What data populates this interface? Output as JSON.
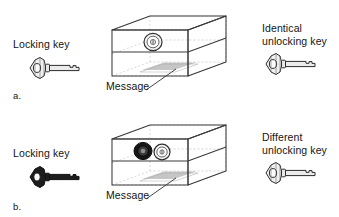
{
  "figure": {
    "type": "cryptography-concept-diagram",
    "panels": [
      {
        "letter": "a.",
        "left_label": "Locking key",
        "right_label": "Identical\nunlocking key",
        "message_label": "Message",
        "left_key_style": "outline",
        "right_key_style": "outline",
        "locks": [
          {
            "style": "outline"
          }
        ]
      },
      {
        "letter": "b.",
        "left_label": "Locking key",
        "right_label": "Different\nunlocking key",
        "message_label": "Message",
        "left_key_style": "filled",
        "right_key_style": "outline",
        "locks": [
          {
            "style": "filled"
          },
          {
            "style": "outline"
          }
        ]
      }
    ]
  },
  "colors": {
    "ink": "#141414",
    "line": "#3a3a3a",
    "faint_line": "#b8b8b8",
    "key_fill_light": "#f2f2f2",
    "key_fill_dark": "#1d1d1d",
    "lock_dark": "#1a1a1a",
    "message_shade": "#b0b0b0",
    "background": "#ffffff"
  }
}
